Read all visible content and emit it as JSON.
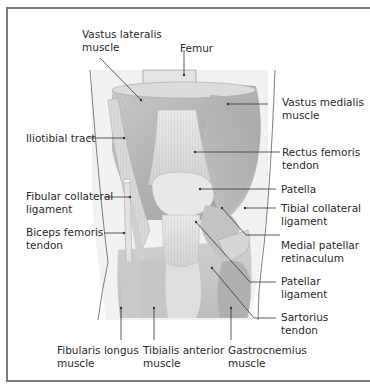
{
  "figure": {
    "colors": {
      "frame": "#7a7a7a",
      "leader": "#333333",
      "muscle": "#b9b9b9",
      "muscle_dark": "#9a9a9a",
      "tendon": "#dcdcdc",
      "bone": "#e6e6e6",
      "skin_bg": "#efefef"
    },
    "labels": {
      "vastus_lateralis": {
        "line1": "Vastus lateralis",
        "line2": "muscle"
      },
      "femur": {
        "line1": "Femur"
      },
      "vastus_medialis": {
        "line1": "Vastus medialis",
        "line2": "muscle"
      },
      "iliotibial_tract": {
        "line1": "Iliotibial tract"
      },
      "rectus_femoris": {
        "line1": "Rectus femoris",
        "line2": "tendon"
      },
      "patella": {
        "line1": "Patella"
      },
      "fibular_collateral": {
        "line1": "Fibular collateral",
        "line2": "ligament"
      },
      "tibial_collateral": {
        "line1": "Tibial collateral",
        "line2": "ligament"
      },
      "biceps_femoris": {
        "line1": "Biceps femoris",
        "line2": "tendon"
      },
      "medial_patellar": {
        "line1": "Medial patellar",
        "line2": "retinaculum"
      },
      "patellar_ligament": {
        "line1": "Patellar",
        "line2": "ligament"
      },
      "sartorius": {
        "line1": "Sartorius",
        "line2": "tendon"
      },
      "fibularis_longus": {
        "line1": "Fibularis longus",
        "line2": "muscle"
      },
      "tibialis_anterior": {
        "line1": "Tibialis anterior",
        "line2": "muscle"
      },
      "gastrocnemius": {
        "line1": "Gastrocnemius",
        "line2": "muscle"
      }
    }
  }
}
